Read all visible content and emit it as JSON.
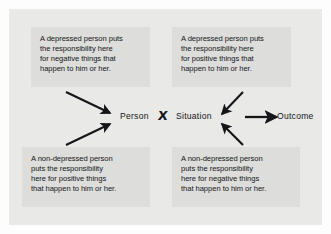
{
  "figure": {
    "type": "concept-diagram",
    "background_color": "#e9e9e7",
    "box_color": "#dddddb",
    "text_color": "#15161a"
  },
  "center": {
    "person_label": "Person",
    "operator_label": "X",
    "situation_label": "Situation",
    "outcome_label": "Outcome",
    "outcome_arrow": "right-arrow-icon"
  },
  "boxes": {
    "top_left": {
      "position": "top-left",
      "lines": [
        "A depressed person puts",
        "the responsibility here",
        "for negative things that",
        "happen to him or her."
      ]
    },
    "top_right": {
      "position": "top-right",
      "lines": [
        "A depressed person puts",
        "the responsibility here",
        "for positive things that",
        "happen to him or her."
      ]
    },
    "bottom_left": {
      "position": "bottom-left",
      "lines": [
        "A non-depressed person",
        "puts the responsibility",
        "here for positive things",
        "that happen to him or her."
      ]
    },
    "bottom_right": {
      "position": "bottom-right",
      "lines": [
        "A non-depressed person",
        "puts the responsibility",
        "here for negative things",
        "that happen to him or her."
      ]
    }
  },
  "arrows": [
    {
      "name": "arrow-from-top-left-box-to-person",
      "direction": "down-right"
    },
    {
      "name": "arrow-from-bottom-left-box-to-person",
      "direction": "up-right"
    },
    {
      "name": "arrow-from-top-right-box-to-situation",
      "direction": "down-left"
    },
    {
      "name": "arrow-from-bottom-right-box-to-situation",
      "direction": "up-left"
    }
  ]
}
